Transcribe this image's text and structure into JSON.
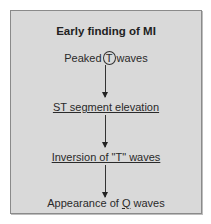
{
  "diagram": {
    "title": "Early finding of MI",
    "steps": [
      {
        "prefix": "Peaked",
        "circled": "T",
        "suffix": "waves"
      },
      {
        "label": "ST segment elevation"
      },
      {
        "label": "Inversion of \"T\" waves"
      },
      {
        "prefix": "Appearance of ",
        "underlined": "Q",
        "suffix": " waves"
      }
    ],
    "colors": {
      "background": "#d9d9d9",
      "border": "#8a8a8a",
      "text": "#2a2a2a"
    }
  }
}
